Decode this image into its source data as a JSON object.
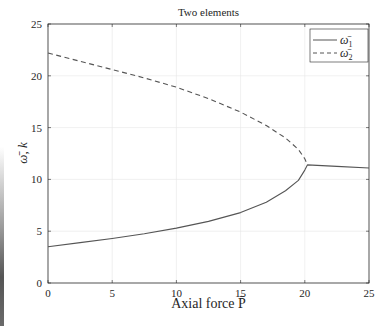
{
  "chart_data": {
    "type": "line",
    "title": "Two elements",
    "xlabel": "Axial force P̄",
    "ylabel": "ω̄, k",
    "xlim": [
      0,
      25
    ],
    "ylim": [
      0,
      25
    ],
    "xticks": [
      0,
      5,
      10,
      15,
      20,
      25
    ],
    "yticks": [
      0,
      5,
      10,
      15,
      20,
      25
    ],
    "grid": true,
    "legend_position": "upper right",
    "series": [
      {
        "name": "ω̄₁",
        "style": "solid",
        "color": "#555555",
        "x": [
          0,
          2.5,
          5,
          7.5,
          10,
          12.5,
          15,
          17,
          18.5,
          19.5,
          20.0,
          20.2,
          22.5,
          25
        ],
        "y": [
          3.5,
          3.9,
          4.3,
          4.75,
          5.3,
          5.95,
          6.8,
          7.8,
          8.9,
          9.9,
          10.9,
          11.4,
          11.25,
          11.1
        ]
      },
      {
        "name": "ω̄₂",
        "style": "dashed",
        "color": "#555555",
        "x": [
          0,
          2.5,
          5,
          7.5,
          10,
          12.5,
          15,
          17,
          18.5,
          19.5,
          20.0,
          20.2
        ],
        "y": [
          22.2,
          21.4,
          20.6,
          19.8,
          18.9,
          17.8,
          16.5,
          15.2,
          14.0,
          12.9,
          12.0,
          11.4
        ]
      }
    ]
  },
  "legend": {
    "items": [
      {
        "label": "ω̄",
        "sub": "1",
        "style": "solid"
      },
      {
        "label": "ω̄",
        "sub": "2",
        "style": "dashed"
      }
    ]
  }
}
